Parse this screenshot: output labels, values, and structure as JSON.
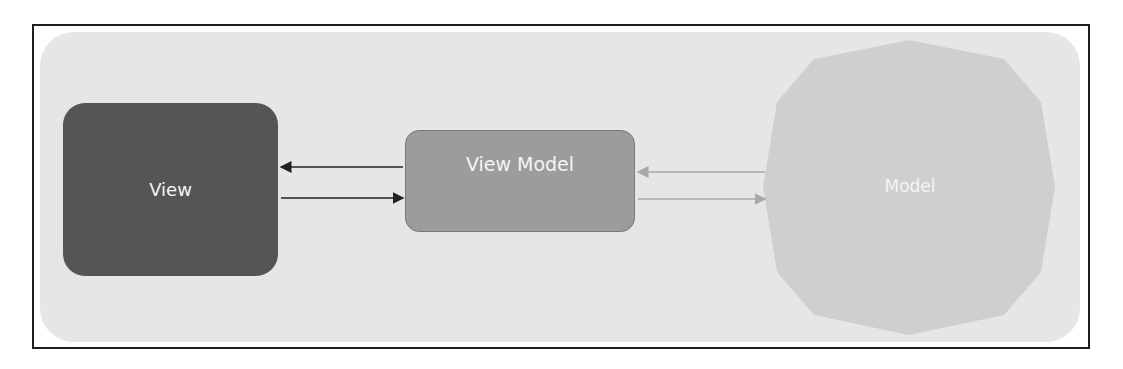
{
  "diagram": {
    "type": "mvvm-architecture",
    "nodes": [
      {
        "id": "view",
        "label": "View",
        "shape": "rounded-rectangle",
        "color": "#555555"
      },
      {
        "id": "view_model",
        "label": "View Model",
        "shape": "rounded-rectangle",
        "color": "#9c9c9c"
      },
      {
        "id": "model",
        "label": "Model",
        "shape": "decagon",
        "color": "#cfcfcf"
      }
    ],
    "edges": [
      {
        "from": "view_model",
        "to": "view",
        "color": "#222222"
      },
      {
        "from": "view",
        "to": "view_model",
        "color": "#222222"
      },
      {
        "from": "model",
        "to": "view_model",
        "color": "#b0b0b0"
      },
      {
        "from": "view_model",
        "to": "model",
        "color": "#b0b0b0"
      }
    ],
    "background_color": "#e6e6e6",
    "frame_color": "#1e1e1e"
  }
}
